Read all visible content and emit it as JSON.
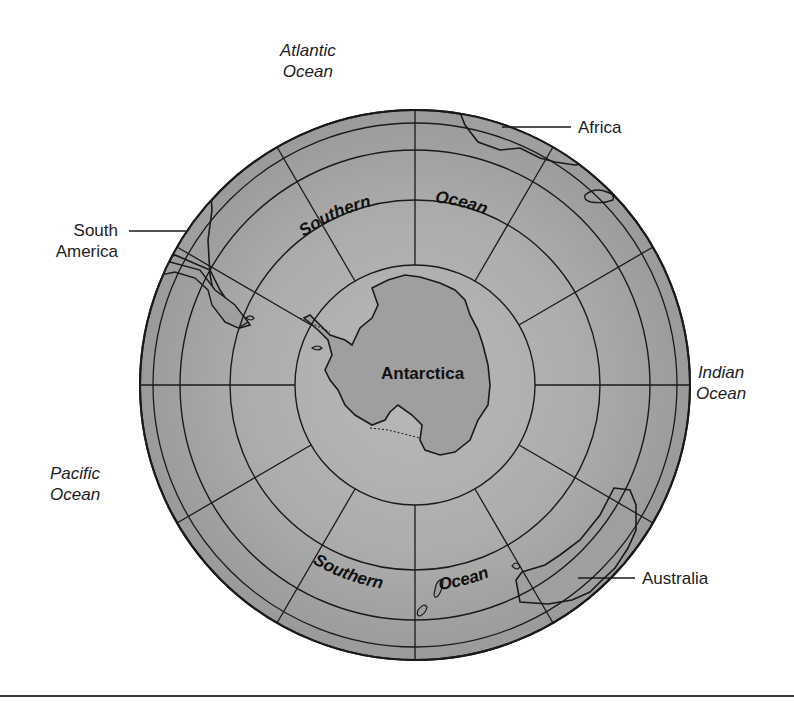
{
  "map": {
    "title": "Southern Ocean polar view",
    "colors": {
      "ocean_fill": "#a9a9a9",
      "land_fill": "#9d9d9d",
      "line": "#1a1a1a",
      "background": "#ffffff"
    },
    "ocean_labels": {
      "atlantic": {
        "line1": "Atlantic",
        "line2": "Ocean"
      },
      "indian": {
        "line1": "Indian",
        "line2": "Ocean"
      },
      "pacific": {
        "line1": "Pacific",
        "line2": "Ocean"
      }
    },
    "southern_ocean_labels": {
      "top_word1": "Southern",
      "top_word2": "Ocean",
      "bottom_word1": "Southern",
      "bottom_word2": "Ocean"
    },
    "continent_labels": {
      "south_america": {
        "line1": "South",
        "line2": "America"
      },
      "africa": "Africa",
      "australia": "Australia",
      "antarctica": "Antarctica"
    }
  }
}
